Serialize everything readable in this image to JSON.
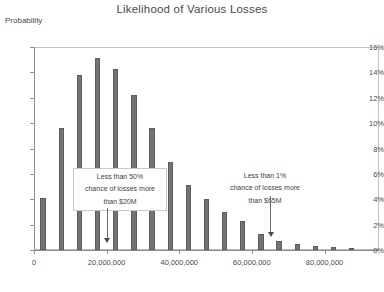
{
  "chart_data": {
    "type": "bar",
    "title": "Likelihood of Various Losses",
    "xlabel": "Loss ($)",
    "ylabel": "Probability",
    "grid": false,
    "legend": "none",
    "ylim": [
      0,
      16
    ],
    "ytick_labels": [
      "0%",
      "2%",
      "4%",
      "6%",
      "8%",
      "10%",
      "12%",
      "14%",
      "16%"
    ],
    "ytick_values": [
      0,
      2,
      4,
      6,
      8,
      10,
      12,
      14,
      16
    ],
    "xlim": [
      0,
      95000000
    ],
    "xtick_labels": [
      "0",
      "20,000,000",
      "40,000,000",
      "60,000,000",
      "80,000,000"
    ],
    "xtick_values": [
      0,
      20000000,
      40000000,
      60000000,
      80000000
    ],
    "bar_width": 2500000,
    "x": [
      2500000,
      7500000,
      12500000,
      17500000,
      22500000,
      27500000,
      32500000,
      37500000,
      42500000,
      47500000,
      52500000,
      57500000,
      62500000,
      67500000,
      72500000,
      77500000,
      82500000,
      87500000
    ],
    "categories": [
      "2.5M",
      "7.5M",
      "12.5M",
      "17.5M",
      "22.5M",
      "27.5M",
      "32.5M",
      "37.5M",
      "42.5M",
      "47.5M",
      "52.5M",
      "57.5M",
      "62.5M",
      "67.5M",
      "72.5M",
      "77.5M",
      "82.5M",
      "87.5M"
    ],
    "values": [
      4.1,
      9.6,
      13.8,
      15.1,
      14.3,
      12.2,
      9.6,
      6.9,
      5.1,
      4.0,
      3.0,
      2.3,
      1.3,
      0.7,
      0.5,
      0.35,
      0.25,
      0.15
    ],
    "annotations": [
      {
        "id": "median-callout",
        "lines": [
          "Less than 50%",
          "chance of losses more",
          "than $20M"
        ],
        "arrow_to_x": 20000000
      },
      {
        "id": "tail-callout",
        "lines": [
          "Less than 1%",
          "chance of losses more",
          "than $65M"
        ],
        "arrow_to_x": 65000000
      }
    ]
  },
  "colors": {
    "bar_fill": "#737373",
    "bar_stroke": "#5d5d5d",
    "axis": "#8e8e8e",
    "text": "#4a4a4a",
    "background": "#ffffff"
  }
}
